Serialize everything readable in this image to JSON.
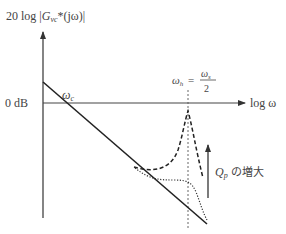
{
  "diagram": {
    "type": "bode-magnitude-sketch",
    "y_axis_label": {
      "prefix": "20 log |",
      "fn": "G",
      "sub": "vc",
      "suffix": "*(jω)|"
    },
    "x_axis_label": "log ω",
    "zero_db_label": "0 dB",
    "crossover_label": {
      "sym": "ω",
      "sub": "c"
    },
    "resonance_label": {
      "lhs_sym": "ω",
      "lhs_sub": "h",
      "eq": "=",
      "num_sym": "ω",
      "num_sub": "s",
      "den": "2"
    },
    "annotation": {
      "sym": "Q",
      "sub": "p",
      "text": " の増大"
    },
    "curves": [
      {
        "name": "asymptote",
        "style": "solid"
      },
      {
        "name": "high-Qp",
        "style": "dashed"
      },
      {
        "name": "low-Qp",
        "style": "dotted"
      }
    ],
    "colors": {
      "line": "#222222",
      "axis": "#333333",
      "guide": "#555555"
    }
  }
}
